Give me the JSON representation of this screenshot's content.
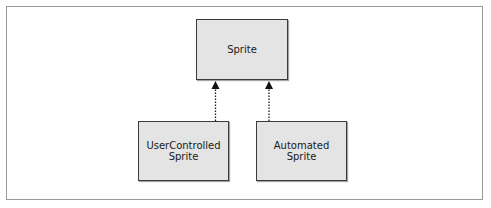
{
  "diagram": {
    "type": "class-inheritance",
    "nodes": [
      {
        "id": "sprite",
        "lines": [
          "Sprite"
        ]
      },
      {
        "id": "user_controlled_sprite",
        "lines": [
          "UserControlled",
          "Sprite"
        ]
      },
      {
        "id": "automated_sprite",
        "lines": [
          "Automated",
          "Sprite"
        ]
      }
    ],
    "edges": [
      {
        "from": "user_controlled_sprite",
        "to": "sprite",
        "style": "dotted",
        "arrow": "filled-triangle"
      },
      {
        "from": "automated_sprite",
        "to": "sprite",
        "style": "dotted",
        "arrow": "filled-triangle"
      }
    ],
    "colors": {
      "node_fill": "#e4e4e4",
      "node_border": "#3a3a3a",
      "edge": "#1a1a1a",
      "frame_border": "#9a9a9a"
    }
  }
}
